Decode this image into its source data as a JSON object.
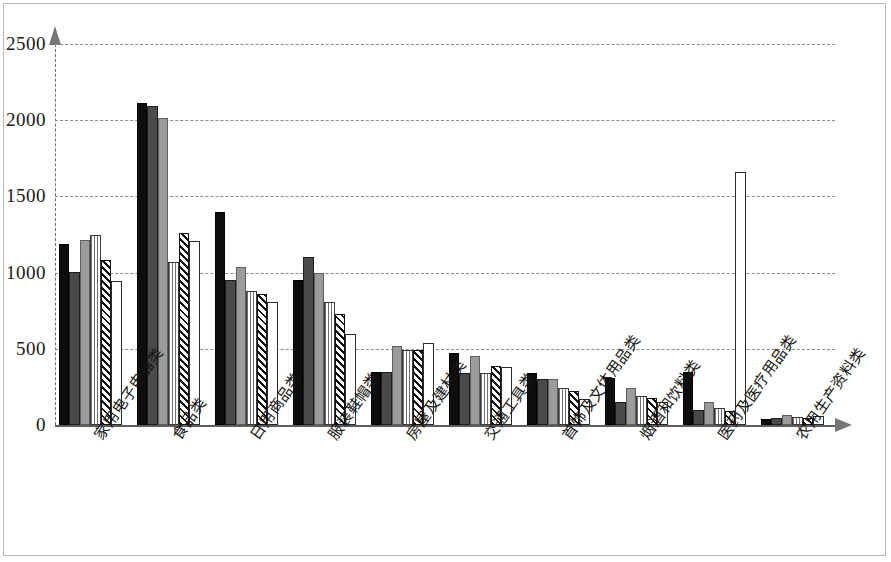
{
  "chart_data": {
    "type": "bar",
    "title": "",
    "subtitle": "",
    "xlabel": "",
    "ylabel": "",
    "ylim": [
      0,
      2500
    ],
    "yticks": [
      0,
      500,
      1000,
      1500,
      2000,
      2500
    ],
    "ytick_labels": [
      "0",
      "500",
      "1000",
      "1500",
      "2000",
      "2500"
    ],
    "grid": true,
    "legend": "none",
    "categories": [
      "家用电子电器类",
      "食品类",
      "日用商品类",
      "服装鞋帽类",
      "房屋及建材类",
      "交通工具类",
      "首饰及文体用品类",
      "烟酒和饮料类",
      "医药及医疗用品类",
      "农用生产资料类"
    ],
    "series": [
      {
        "name": "series-1-black",
        "fill": "#0d0d0d",
        "values": [
          1190,
          2115,
          1400,
          950,
          350,
          470,
          340,
          310,
          350,
          40
        ]
      },
      {
        "name": "series-2-dark-gray",
        "fill": "#4a4a4a",
        "values": [
          1005,
          2090,
          950,
          1100,
          350,
          340,
          300,
          150,
          100,
          45
        ]
      },
      {
        "name": "series-3-medium-gray",
        "fill": "#9b9b9b",
        "values": [
          1215,
          2015,
          1040,
          1000,
          520,
          450,
          300,
          240,
          150,
          65
        ]
      },
      {
        "name": "series-4-vertical-stripe",
        "fill": "#ffffff",
        "values": [
          1245,
          1070,
          880,
          810,
          490,
          340,
          240,
          190,
          110,
          55
        ]
      },
      {
        "name": "series-5-diagonal-hatch",
        "fill": "#ffffff",
        "values": [
          1080,
          1260,
          860,
          730,
          490,
          390,
          220,
          180,
          95,
          45
        ]
      },
      {
        "name": "series-6-white",
        "fill": "#ffffff",
        "values": [
          945,
          1205,
          810,
          600,
          540,
          380,
          170,
          150,
          1660,
          60
        ]
      }
    ]
  },
  "axes": {
    "y_axis_name": "value-axis",
    "x_axis_name": "category-axis"
  }
}
